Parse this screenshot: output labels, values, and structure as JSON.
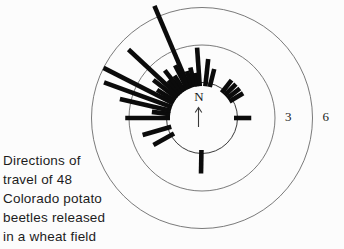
{
  "caption": {
    "lines": [
      "Directions of",
      "travel of 48",
      "Colorado potato",
      "beetles released",
      "in a wheat field"
    ]
  },
  "compass": {
    "label": "N"
  },
  "chart_data": {
    "type": "rose",
    "title": "Directions of travel of 48 Colorado potato beetles released in a wheat field",
    "orientation": "north-up",
    "center_label": "N",
    "rings": [
      {
        "value": 3,
        "label": "3"
      },
      {
        "value": 6,
        "label": "6"
      }
    ],
    "base_value": 0,
    "bar_color": "#0b0b0b",
    "ring_color": "#6b6b6b",
    "bars": [
      {
        "bearing_deg": 6,
        "value": 1.9
      },
      {
        "bearing_deg": 14,
        "value": 1.2
      },
      {
        "bearing_deg": 38,
        "value": 1.0
      },
      {
        "bearing_deg": 45,
        "value": 1.0
      },
      {
        "bearing_deg": 52,
        "value": 1.0
      },
      {
        "bearing_deg": 59,
        "value": 1.0
      },
      {
        "bearing_deg": 90,
        "value": 1.1
      },
      {
        "bearing_deg": 181,
        "value": 1.6
      },
      {
        "bearing_deg": 241,
        "value": 1.6
      },
      {
        "bearing_deg": 254,
        "value": 2.1
      },
      {
        "bearing_deg": 270,
        "value": 3.3
      },
      {
        "bearing_deg": 277,
        "value": 1.2
      },
      {
        "bearing_deg": 283,
        "value": 3.9
      },
      {
        "bearing_deg": 290,
        "value": 5.5
      },
      {
        "bearing_deg": 297,
        "value": 6.0
      },
      {
        "bearing_deg": 302,
        "value": 1.4
      },
      {
        "bearing_deg": 308,
        "value": 2.1
      },
      {
        "bearing_deg": 313,
        "value": 5.2
      },
      {
        "bearing_deg": 318,
        "value": 1.2
      },
      {
        "bearing_deg": 322,
        "value": 2.0
      },
      {
        "bearing_deg": 327,
        "value": 1.2
      },
      {
        "bearing_deg": 333,
        "value": 1.9
      },
      {
        "bearing_deg": 337,
        "value": 6.9
      },
      {
        "bearing_deg": 342,
        "value": 1.1
      },
      {
        "bearing_deg": 347,
        "value": 1.3
      },
      {
        "bearing_deg": 352,
        "value": 0.8
      },
      {
        "bearing_deg": 356,
        "value": 2.8
      }
    ]
  }
}
